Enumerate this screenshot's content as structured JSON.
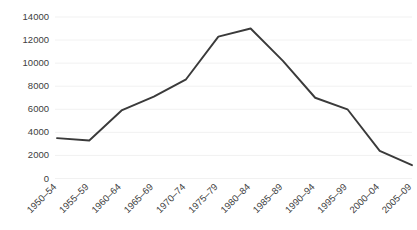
{
  "chart_data": {
    "type": "line",
    "title": "",
    "subtitle": "",
    "xlabel": "",
    "ylabel": "",
    "categories": [
      "1950–54",
      "1955–59",
      "1960–64",
      "1965–69",
      "1970–74",
      "1975–79",
      "1980–84",
      "1985–89",
      "1990–94",
      "1995–99",
      "2000–04",
      "2005–09"
    ],
    "values": [
      3500,
      3300,
      5900,
      7100,
      8600,
      12300,
      13000,
      10200,
      7000,
      6000,
      2400,
      1150
    ],
    "series": [
      {
        "name": "",
        "values": [
          3500,
          3300,
          5900,
          7100,
          8600,
          12300,
          13000,
          10200,
          7000,
          6000,
          2400,
          1150
        ]
      }
    ],
    "ylim": [
      0,
      14000
    ],
    "yticks": [
      0,
      2000,
      4000,
      6000,
      8000,
      10000,
      12000,
      14000
    ],
    "ytick_labels": [
      "0",
      "2000",
      "4000",
      "6000",
      "8000",
      "10000",
      "12000",
      "14000"
    ],
    "grid": true,
    "grid_axis": "y",
    "legend": false,
    "legend_position": "none",
    "line_color": "#3a3a3a",
    "grid_color": "#ededed",
    "background_color": "#ffffff",
    "tick_label_color": "#404040",
    "xtick_rotation": -45
  }
}
